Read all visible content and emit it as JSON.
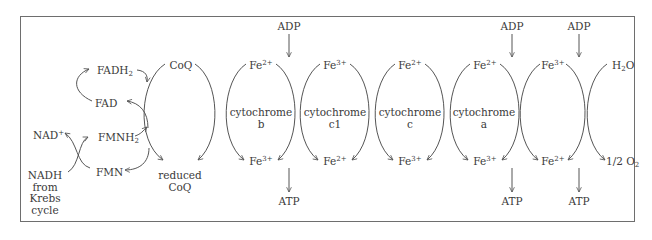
{
  "diagram": {
    "left": {
      "fadh2": {
        "base": "FADH",
        "sub": "2"
      },
      "fad": "FAD",
      "fmnh2": {
        "base": "FMNH",
        "sub": "2"
      },
      "fmn": "FMN",
      "nad_plus": {
        "base": "NAD",
        "sup": "+"
      },
      "nadh_lines": [
        "NADH",
        "from",
        "Krebs",
        "cycle"
      ]
    },
    "coq": {
      "top": "CoQ",
      "bottom_lines": [
        "reduced",
        "CoQ"
      ]
    },
    "cytochromes": [
      {
        "name_lines": [
          "cytochrome",
          "b"
        ],
        "top": {
          "base": "Fe",
          "sup": "2+"
        },
        "bottom": {
          "base": "Fe",
          "sup": "3+"
        }
      },
      {
        "name_lines": [
          "cytochrome",
          "c1"
        ],
        "top": {
          "base": "Fe",
          "sup": "3+"
        },
        "bottom": {
          "base": "Fe",
          "sup": "2+"
        }
      },
      {
        "name_lines": [
          "cytochrome",
          "c"
        ],
        "top": {
          "base": "Fe",
          "sup": "2+"
        },
        "bottom": {
          "base": "Fe",
          "sup": "3+"
        }
      },
      {
        "name_lines": [
          "cytochrome",
          "a"
        ],
        "top": {
          "base": "Fe",
          "sup": "2+"
        },
        "bottom": {
          "base": "Fe",
          "sup": "3+"
        }
      },
      {
        "name_lines": [
          "",
          ""
        ],
        "top": {
          "base": "Fe",
          "sup": "3+"
        },
        "bottom": {
          "base": "Fe",
          "sup": "2+"
        }
      }
    ],
    "oxygen": {
      "top": {
        "pre": "H",
        "sub": "2",
        "post": "O"
      },
      "bottom": {
        "frac": "1/2",
        "base": "O",
        "sub": "2"
      }
    },
    "phosphorylation": [
      {
        "input": "ADP",
        "output": "ATP"
      },
      {
        "input": "ADP",
        "output": "ATP"
      },
      {
        "input": "ADP",
        "output": "ATP"
      }
    ]
  }
}
